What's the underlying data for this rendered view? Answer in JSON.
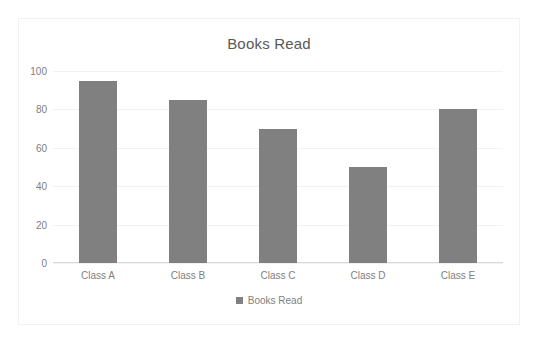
{
  "chart_data": {
    "type": "bar",
    "title": "Books Read",
    "categories": [
      "Class A",
      "Class B",
      "Class C",
      "Class D",
      "Class E"
    ],
    "values": [
      95,
      85,
      70,
      50,
      80
    ],
    "series": [
      {
        "name": "Books Read",
        "values": [
          95,
          85,
          70,
          50,
          80
        ]
      }
    ],
    "xlabel": "",
    "ylabel": "",
    "ylim": [
      0,
      100
    ],
    "yticks": [
      0,
      20,
      40,
      60,
      80,
      100
    ],
    "ytick_labels": [
      "0",
      "20",
      "40",
      "60",
      "80",
      "100"
    ],
    "grid": true,
    "legend_position": "bottom",
    "legend_entries": [
      "Books Read"
    ],
    "colors": {
      "bar": "#808080",
      "gridline": "#f2f2f2",
      "axis": "#d9d9d9",
      "text": "#808080",
      "title_text": "#595959",
      "background": "#ffffff",
      "frame_border": "#f2f2f2"
    }
  }
}
